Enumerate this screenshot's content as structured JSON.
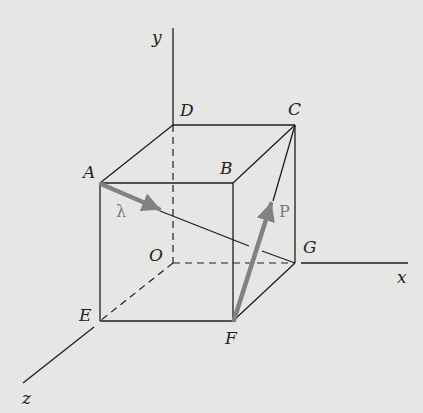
{
  "diagram": {
    "axes": {
      "x": "x",
      "y": "y",
      "z": "z"
    },
    "points": {
      "A": "A",
      "B": "B",
      "C": "C",
      "D": "D",
      "E": "E",
      "F": "F",
      "G": "G",
      "O": "O"
    },
    "vectors": {
      "lambda": {
        "label": "λ",
        "from": "A",
        "toward": "G"
      },
      "P": {
        "label": "P",
        "from": "F",
        "toward": "C"
      }
    },
    "colors": {
      "background": "#e6e6e4",
      "lines": "#1e1e1e",
      "vectors": "#828282"
    }
  }
}
